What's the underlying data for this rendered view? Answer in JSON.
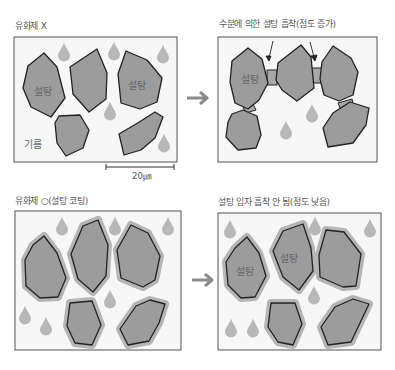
{
  "panels": {
    "top_left": {
      "caption": "유화제 X",
      "sugar_labels": [
        "설탕",
        "설탕"
      ],
      "oil_label": "기름",
      "scale_bar": "20㎛"
    },
    "top_right": {
      "caption": "수분에 의한 설탕 흡착(점도 증가)",
      "sugar_labels": [
        "설탕"
      ]
    },
    "bottom_left": {
      "caption": "유화제 ○(설탕 코팅)"
    },
    "bottom_right": {
      "caption": "설탕 입자 흡착 안 됨(점도 낮음)",
      "sugar_labels": [
        "설탕",
        "설탕"
      ]
    }
  },
  "colors": {
    "particle_fill": "#9c9c9c",
    "particle_stroke": "#222222",
    "coating": "#b5b5b5",
    "water_drop": "#b8b8b8",
    "frame_bg": "#f7f7f7",
    "frame_stroke": "#555555",
    "arrow": "#8a8a8a"
  }
}
